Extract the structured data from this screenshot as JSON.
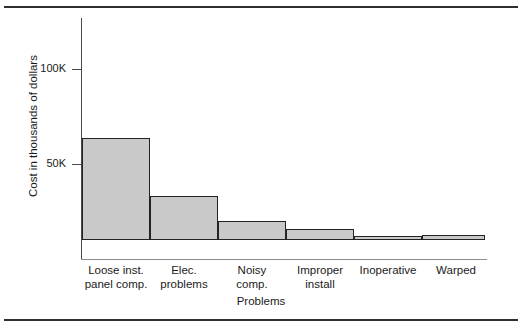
{
  "chart_data": {
    "type": "bar",
    "title": "",
    "xlabel": "Problems",
    "ylabel": "Cost in thousands of dollars",
    "categories": [
      "Loose inst. panel comp.",
      "Elec. problems",
      "Noisy comp.",
      "Improper install",
      "Inoperative",
      "Warped"
    ],
    "category_lines": [
      [
        "Loose inst.",
        "panel comp."
      ],
      [
        "Elec.",
        "problems"
      ],
      [
        "Noisy",
        "comp."
      ],
      [
        "Improper",
        "install"
      ],
      [
        "Inoperative",
        ""
      ],
      [
        "Warped",
        ""
      ]
    ],
    "values": [
      117,
      54,
      23,
      10,
      6,
      2
    ],
    "ylim": [
      0,
      127
    ],
    "yticks": [
      50,
      100
    ],
    "ytick_labels": [
      "50K",
      "100K"
    ],
    "grid": false,
    "legend": null,
    "bar_fill": "#c9c9c9",
    "bar_edge": "#232323",
    "axis_color": "#4a4a4a",
    "baseline_color": "#8d8d8d",
    "rule_color": "#2e2e2e"
  },
  "axis": {
    "ylabel": "Cost in thousands of dollars",
    "xlabel": "Problems",
    "ytick_100": "100K",
    "ytick_50": "50K"
  },
  "bars": [
    {
      "label_line1": "Loose inst.",
      "label_line2": "panel comp.",
      "value": 117
    },
    {
      "label_line1": "Elec.",
      "label_line2": "problems",
      "value": 54
    },
    {
      "label_line1": "Noisy",
      "label_line2": "comp.",
      "value": 23
    },
    {
      "label_line1": "Improper",
      "label_line2": "install",
      "value": 10
    },
    {
      "label_line1": "Inoperative",
      "label_line2": "",
      "value": 6
    },
    {
      "label_line1": "Warped",
      "label_line2": "",
      "value": 2
    }
  ]
}
